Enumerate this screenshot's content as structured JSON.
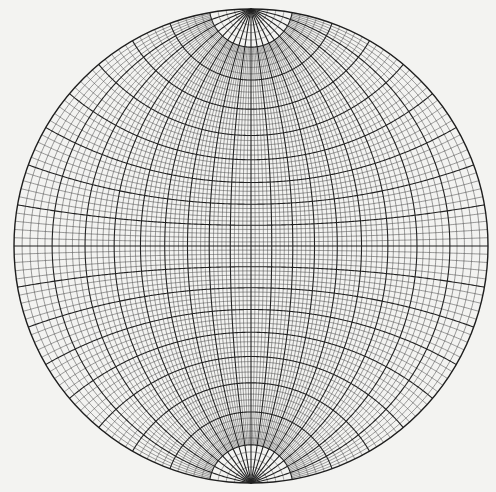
{
  "figure": {
    "type": "stereographic-net",
    "name": "Wulff net (transverse, N-S pole axis vertical)",
    "width": 496,
    "height": 492,
    "center": [
      251,
      246
    ],
    "radius": 237,
    "minor_interval_deg": 2,
    "major_interval_deg": 10,
    "polar_cap_latitude_deg": 80,
    "colors": {
      "background": "#f3f3f1",
      "minor_line": "#4a4a4a",
      "major_line": "#222222",
      "primitive": "#1e1e1e"
    },
    "stroke_widths": {
      "minor": 0.55,
      "major": 1.1,
      "primitive": 1.4
    }
  }
}
